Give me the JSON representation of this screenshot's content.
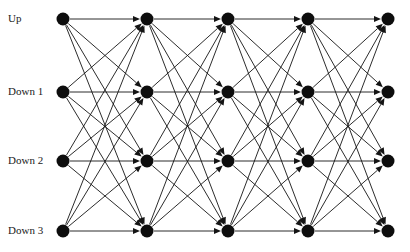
{
  "figure": {
    "kind": "trellis-diagram",
    "title": "",
    "background_color": "#ffffff",
    "node_color": "#0d0d0d",
    "edge_color": "#141414",
    "label_color": "#1a1a1a",
    "width": 410,
    "height": 252
  },
  "axis": {
    "row_labels": [
      {
        "id": "up",
        "label": "Up"
      },
      {
        "id": "down-1",
        "label": "Down 1"
      },
      {
        "id": "down-2",
        "label": "Down 2"
      },
      {
        "id": "down-3",
        "label": "Down 3"
      }
    ],
    "label_x": 8,
    "row_y": [
      19,
      92,
      161,
      231
    ]
  },
  "graph": {
    "stage_count": 5,
    "state_count": 4,
    "fully_connected": true,
    "node_radius": 6.5,
    "column_x": [
      63,
      147,
      228,
      308,
      388
    ],
    "row_y": [
      19,
      92,
      161,
      231
    ],
    "state_names": [
      "Up",
      "Down 1",
      "Down 2",
      "Down 3"
    ],
    "nodes": [
      {
        "stage": 0,
        "state": 0,
        "x": 63,
        "y": 19
      },
      {
        "stage": 0,
        "state": 1,
        "x": 63,
        "y": 92
      },
      {
        "stage": 0,
        "state": 2,
        "x": 63,
        "y": 161
      },
      {
        "stage": 0,
        "state": 3,
        "x": 63,
        "y": 231
      },
      {
        "stage": 1,
        "state": 0,
        "x": 147,
        "y": 19
      },
      {
        "stage": 1,
        "state": 1,
        "x": 147,
        "y": 92
      },
      {
        "stage": 1,
        "state": 2,
        "x": 147,
        "y": 161
      },
      {
        "stage": 1,
        "state": 3,
        "x": 147,
        "y": 231
      },
      {
        "stage": 2,
        "state": 0,
        "x": 228,
        "y": 19
      },
      {
        "stage": 2,
        "state": 1,
        "x": 228,
        "y": 92
      },
      {
        "stage": 2,
        "state": 2,
        "x": 228,
        "y": 161
      },
      {
        "stage": 2,
        "state": 3,
        "x": 228,
        "y": 231
      },
      {
        "stage": 3,
        "state": 0,
        "x": 308,
        "y": 19
      },
      {
        "stage": 3,
        "state": 1,
        "x": 308,
        "y": 92
      },
      {
        "stage": 3,
        "state": 2,
        "x": 308,
        "y": 161
      },
      {
        "stage": 3,
        "state": 3,
        "x": 308,
        "y": 231
      },
      {
        "stage": 4,
        "state": 0,
        "x": 388,
        "y": 19
      },
      {
        "stage": 4,
        "state": 1,
        "x": 388,
        "y": 92
      },
      {
        "stage": 4,
        "state": 2,
        "x": 388,
        "y": 161
      },
      {
        "stage": 4,
        "state": 3,
        "x": 388,
        "y": 231
      }
    ],
    "transitions_per_stage": [
      [
        0,
        0
      ],
      [
        0,
        1
      ],
      [
        0,
        2
      ],
      [
        0,
        3
      ],
      [
        1,
        0
      ],
      [
        1,
        1
      ],
      [
        1,
        2
      ],
      [
        1,
        3
      ],
      [
        2,
        0
      ],
      [
        2,
        1
      ],
      [
        2,
        2
      ],
      [
        2,
        3
      ],
      [
        3,
        0
      ],
      [
        3,
        1
      ],
      [
        3,
        2
      ],
      [
        3,
        3
      ]
    ],
    "edges_per_stage": 16,
    "total_edges": 64
  }
}
